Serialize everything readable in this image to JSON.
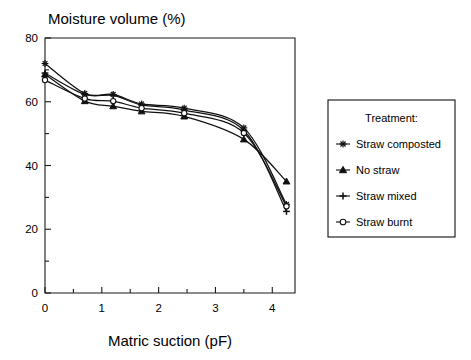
{
  "chart_data": {
    "type": "line",
    "title": "Moisture volume (%)",
    "xlabel": "Matric suction (pF)",
    "ylabel": "Moisture volume (%)",
    "xlim": [
      0,
      4.4
    ],
    "ylim": [
      0,
      80
    ],
    "grid": false,
    "x": [
      0,
      0.7,
      1.2,
      1.7,
      2.45,
      3.5,
      4.25
    ],
    "xticks": [
      0,
      1,
      2,
      3,
      4
    ],
    "xtick_labels": [
      "0",
      "1",
      "2",
      "3",
      "4"
    ],
    "xminor_ticks": [
      0.5,
      1.5,
      2.5,
      3.5
    ],
    "yticks": [
      0,
      20,
      40,
      60,
      80
    ],
    "ytick_labels": [
      "0",
      "20",
      "40",
      "60",
      "80"
    ],
    "yminor_ticks": [
      10,
      30,
      50,
      70
    ],
    "legend": {
      "title": "Treatment:",
      "position": "right-outside",
      "entries": [
        {
          "name": "Straw composted",
          "marker": "star-asterisk"
        },
        {
          "name": "No straw",
          "marker": "filled-triangle"
        },
        {
          "name": "Straw mixed",
          "marker": "plus-cross"
        },
        {
          "name": "Straw burnt",
          "marker": "open-circle"
        }
      ]
    },
    "series": [
      {
        "name": "Straw composted",
        "marker": "star-asterisk",
        "values": [
          72.0,
          62.6,
          62.3,
          59.3,
          58.0,
          51.8,
          27.8
        ]
      },
      {
        "name": "No straw",
        "marker": "filled-triangle",
        "values": [
          68.6,
          60.2,
          58.6,
          57.0,
          55.4,
          48.2,
          35.0
        ]
      },
      {
        "name": "Straw mixed",
        "marker": "plus-cross",
        "values": [
          69.0,
          62.3,
          62.0,
          59.0,
          57.4,
          51.0,
          25.6
        ]
      },
      {
        "name": "Straw burnt",
        "marker": "open-circle",
        "values": [
          66.8,
          61.0,
          60.2,
          58.0,
          56.4,
          50.2,
          27.2
        ]
      }
    ]
  }
}
